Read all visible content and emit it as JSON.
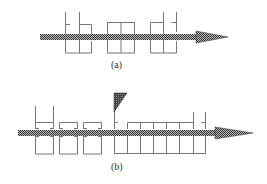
{
  "figure": {
    "panels": [
      {
        "id": "a",
        "label": "(a)"
      },
      {
        "id": "b",
        "label": "(b)"
      }
    ],
    "colors": {
      "line": "#777777",
      "arrow_dark": "#333333",
      "arrow_light": "#bbbbbb",
      "hatch": "#222222"
    }
  }
}
